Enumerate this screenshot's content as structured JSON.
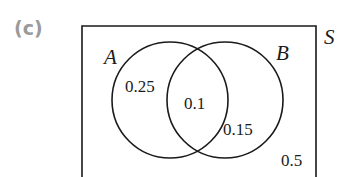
{
  "part_label": "(c)",
  "diagram": {
    "type": "venn",
    "universe_label": "S",
    "sets": [
      {
        "name": "A",
        "only_value": "0.25"
      },
      {
        "name": "B",
        "only_value": "0.15"
      }
    ],
    "intersection_value": "0.1",
    "outside_value": "0.5"
  },
  "colors": {
    "line": "#1a1a1a",
    "part_label": "#9a9a9a"
  }
}
